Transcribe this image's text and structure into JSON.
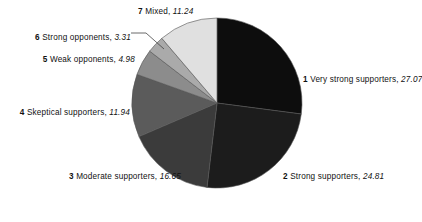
{
  "chart_data": {
    "type": "pie",
    "title": "",
    "subtitle": "",
    "xlabel": "",
    "ylabel": "",
    "legend_position": "callout-labels",
    "grid": false,
    "total": 100.0,
    "start_angle_deg": 0,
    "direction": "clockwise",
    "categories": [
      "Very strong supporters",
      "Strong supporters",
      "Moderate supporters",
      "Skeptical supporters",
      "Weak opponents",
      "Strong opponents",
      "Mixed"
    ],
    "values": [
      27.07,
      24.81,
      16.65,
      11.94,
      4.98,
      3.31,
      11.24
    ],
    "slices": [
      {
        "index": "1",
        "label": "Very strong supporters",
        "value": "27.07",
        "num": 27.07,
        "color": "#0d0d0d",
        "side": "right"
      },
      {
        "index": "2",
        "label": "Strong supporters",
        "value": "24.81",
        "num": 24.81,
        "color": "#1c1c1c",
        "side": "right"
      },
      {
        "index": "3",
        "label": "Moderate supporters",
        "value": "16.65",
        "num": 16.65,
        "color": "#3b3b3b",
        "side": "left"
      },
      {
        "index": "4",
        "label": "Skeptical supporters",
        "value": "11.94",
        "num": 11.94,
        "color": "#5b5b5b",
        "side": "left"
      },
      {
        "index": "5",
        "label": "Weak opponents",
        "value": "4.98",
        "num": 4.98,
        "color": "#8c8c8c",
        "side": "left"
      },
      {
        "index": "6",
        "label": "Strong opponents",
        "value": "3.31",
        "num": 3.31,
        "color": "#aaaaaa",
        "side": "left"
      },
      {
        "index": "7",
        "label": "Mixed",
        "value": "11.24",
        "num": 11.24,
        "color": "#e0e0e0",
        "side": "top"
      }
    ],
    "separator": ", ",
    "geometry": {
      "cx": 217,
      "cy": 103,
      "r": 85
    },
    "background": "#ffffff",
    "text_color": "#111111",
    "outline_color": "#555555"
  }
}
